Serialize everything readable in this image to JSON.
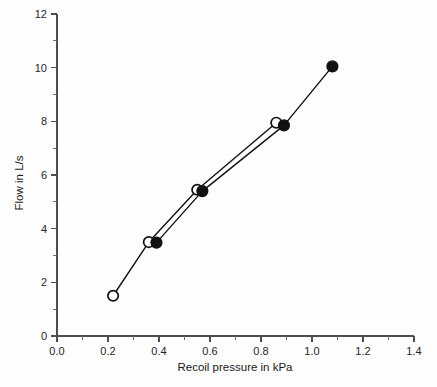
{
  "chart_data": {
    "type": "line",
    "title": "",
    "subtitle": "",
    "xlabel": "Recoil pressure in kPa",
    "ylabel": "Flow in L/s",
    "xlim": [
      0.0,
      1.4
    ],
    "ylim": [
      0,
      12
    ],
    "x_ticks": [
      0.0,
      0.2,
      0.4,
      0.6,
      0.8,
      1.0,
      1.2,
      1.4
    ],
    "x_tick_labels": [
      "0.0",
      "0.2",
      "0.4",
      "0.6",
      "0.8",
      "1.0",
      "1.2",
      "1.4"
    ],
    "x_minor_ticks": [
      0.1,
      0.3,
      0.5,
      0.7,
      0.9,
      1.1,
      1.3
    ],
    "y_ticks": [
      0,
      2,
      4,
      6,
      8,
      10,
      12
    ],
    "y_tick_labels": [
      "0",
      "2",
      "4",
      "6",
      "8",
      "10",
      "12"
    ],
    "y_minor_ticks": [
      1,
      3,
      5,
      7,
      9,
      11
    ],
    "grid": false,
    "legend": "none",
    "marker_colors": {
      "open": "#ffffff",
      "filled": "#111111",
      "stroke": "#111111"
    },
    "series": [
      {
        "name": "open-circles",
        "marker": "open-circle",
        "points": [
          {
            "x": 0.22,
            "y": 1.5
          },
          {
            "x": 0.36,
            "y": 3.5
          },
          {
            "x": 0.55,
            "y": 5.45
          },
          {
            "x": 0.86,
            "y": 7.95
          }
        ]
      },
      {
        "name": "filled-circles",
        "marker": "filled-circle",
        "points": [
          {
            "x": 0.39,
            "y": 3.48
          },
          {
            "x": 0.57,
            "y": 5.4
          },
          {
            "x": 0.89,
            "y": 7.85
          },
          {
            "x": 1.08,
            "y": 10.05
          }
        ]
      }
    ]
  },
  "axes": {
    "x_title": "Recoil pressure in kPa",
    "y_title": "Flow in L/s"
  }
}
